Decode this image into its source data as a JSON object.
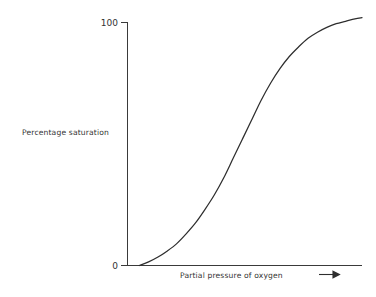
{
  "chart_data": {
    "type": "line",
    "title": "",
    "subtitle": "",
    "xlabel": "Partial pressure of oxygen",
    "ylabel": "Percentage saturation",
    "x_axis_arrow": "right-arrow",
    "grid": false,
    "legend": null,
    "xlim": [
      0,
      100
    ],
    "ylim": [
      0,
      110
    ],
    "x_tick_labels": [],
    "y_tick_labels": [
      "0",
      "100"
    ],
    "y_ticks": [
      0,
      100
    ],
    "series": [
      {
        "name": "Oxygen dissociation curve",
        "color": "#2e2e2e",
        "x": [
          5,
          9,
          13,
          17,
          21,
          25,
          29,
          33,
          37,
          41,
          45,
          49,
          53,
          57,
          61,
          65,
          69,
          73,
          77,
          81,
          85,
          89,
          93,
          97,
          100
        ],
        "y": [
          0,
          1.5,
          3.5,
          6,
          9,
          13,
          17.5,
          23,
          29,
          36,
          44,
          52,
          60,
          68,
          75,
          81,
          86,
          90,
          93.5,
          96,
          98,
          99.5,
          100.5,
          101.5,
          102
        ]
      }
    ],
    "annotations": []
  },
  "axis": {
    "y_tick_top_label": "100",
    "y_tick_zero_label": "0",
    "y_axis_title": "Percentage saturation",
    "x_axis_title": "Partial pressure of oxygen"
  },
  "colors": {
    "curve": "#2e2e2e",
    "axis": "#3a3a3a",
    "text": "#333333",
    "background": "#ffffff"
  }
}
